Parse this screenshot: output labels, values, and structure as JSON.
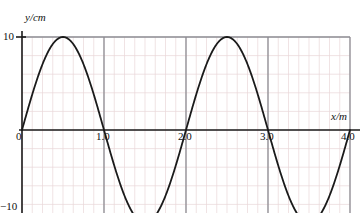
{
  "figure": {
    "y_axis_label": "y/cm",
    "x_axis_label": "x/m",
    "y_tick_top": "10",
    "y_tick_bottom": "−10",
    "x_ticks": [
      "0",
      "1.0",
      "2.0",
      "3.0",
      "4.0"
    ],
    "colors": {
      "curve": "#1a1a1a",
      "axis": "#1a1a1a",
      "major_grid": "#8d8d93",
      "minor_grid": "#e9d7d9",
      "background": "#ffffff"
    }
  },
  "chart_data": {
    "type": "line",
    "title": "",
    "xlabel": "x/m",
    "ylabel": "y/cm",
    "xlim": [
      0,
      4.0
    ],
    "ylim": [
      -10,
      10
    ],
    "grid": true,
    "legend": "none",
    "x_tick_values": [
      0,
      1.0,
      2.0,
      3.0,
      4.0
    ],
    "y_tick_values": [
      10,
      -10
    ],
    "minor_grid_step_x": 0.125,
    "minor_grid_step_y": 2.0,
    "waveform": {
      "equation": "y = 10 sin(pi x)",
      "amplitude_cm": 10,
      "wavelength_m": 2.0,
      "phase": 0
    },
    "zero_crossings": [
      0,
      1.0,
      2.0,
      3.0,
      4.0
    ],
    "crests": [
      {
        "x": 0.5,
        "y": 10
      },
      {
        "x": 2.5,
        "y": 10
      }
    ],
    "troughs": [
      {
        "x": 1.5,
        "y": -10
      },
      {
        "x": 3.5,
        "y": -10
      }
    ],
    "series": [
      {
        "name": "wave",
        "x": [
          0,
          0.1,
          0.2,
          0.3,
          0.4,
          0.5,
          0.6,
          0.7,
          0.8,
          0.9,
          1.0,
          1.1,
          1.2,
          1.3,
          1.4,
          1.5,
          1.6,
          1.7,
          1.8,
          1.9,
          2.0,
          2.1,
          2.2,
          2.3,
          2.4,
          2.5,
          2.6,
          2.7,
          2.8,
          2.9,
          3.0,
          3.1,
          3.2,
          3.3,
          3.4,
          3.5,
          3.6,
          3.7,
          3.8,
          3.9,
          4.0
        ],
        "values": [
          0,
          3.09,
          5.88,
          8.09,
          9.51,
          10,
          9.51,
          8.09,
          5.88,
          3.09,
          0,
          -3.09,
          -5.88,
          -8.09,
          -9.51,
          -10,
          -9.51,
          -8.09,
          -5.88,
          -3.09,
          0,
          3.09,
          5.88,
          8.09,
          9.51,
          10,
          9.51,
          8.09,
          5.88,
          3.09,
          0,
          -3.09,
          -5.88,
          -8.09,
          -9.51,
          -10,
          -9.51,
          -8.09,
          -5.88,
          -3.09,
          0
        ]
      }
    ]
  }
}
